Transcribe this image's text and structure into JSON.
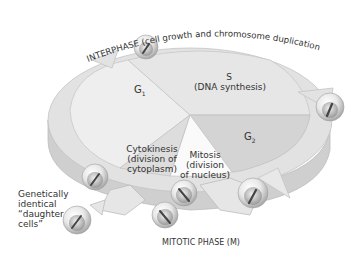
{
  "diagram": {
    "interphase_label": "INTERPHASE (cell growth and chromosome duplication)",
    "mitotic_phase_label": "MITOTIC PHASE (M)",
    "phases": {
      "g1": {
        "label": "G",
        "subscript": "1"
      },
      "s": {
        "label": "S",
        "description": "(DNA synthesis)"
      },
      "g2": {
        "label": "G",
        "subscript": "2"
      },
      "cytokinesis": {
        "label": "Cytokinesis",
        "line2": "(division of",
        "line3": "cytoplasm)"
      },
      "mitosis": {
        "label": "Mitosis",
        "line2": "(division",
        "line3": "of nucleus)"
      }
    },
    "daughter_cells": {
      "line1": "Genetically",
      "line2": "identical",
      "line3": "“daughter",
      "line4": "cells”"
    },
    "colors": {
      "ring_top": "#e4e4e4",
      "ring_side": "#cfcfcf",
      "g1_fill": "#eeeeee",
      "s_fill": "#e6e6e6",
      "g2_fill": "#d4d4d4",
      "mitosis_fill": "#fafafa",
      "cytokinesis_fill": "#dddddd",
      "text": "#333333"
    }
  }
}
